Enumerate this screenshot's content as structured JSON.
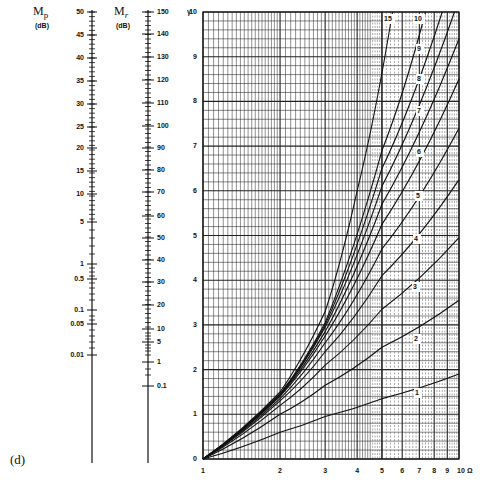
{
  "panel_label": "(d)",
  "scales": {
    "mp": {
      "title_main": "M",
      "title_sub": "p",
      "unit": "(dB)",
      "ticks": [
        {
          "label": "50",
          "y": 12
        },
        {
          "label": "45",
          "y": 35
        },
        {
          "label": "40",
          "y": 58
        },
        {
          "label": "35",
          "y": 81
        },
        {
          "label": "30",
          "y": 104
        },
        {
          "label": "25",
          "y": 127
        },
        {
          "label": "20",
          "y": 148
        },
        {
          "label": "15",
          "y": 171
        },
        {
          "label": "10",
          "y": 194
        },
        {
          "label": "5",
          "y": 222
        },
        {
          "label": "1",
          "y": 264
        },
        {
          "label": "0.5",
          "y": 279
        },
        {
          "label": "0.1",
          "y": 310
        },
        {
          "label": "0.05",
          "y": 324
        },
        {
          "label": "0.01",
          "y": 355
        }
      ]
    },
    "mr": {
      "title_main": "M",
      "title_sub": "r",
      "unit": "(dB)",
      "ticks": [
        {
          "label": "150",
          "y": 12
        },
        {
          "label": "140",
          "y": 34
        },
        {
          "label": "130",
          "y": 57
        },
        {
          "label": "120",
          "y": 80
        },
        {
          "label": "110",
          "y": 103
        },
        {
          "label": "100",
          "y": 126
        },
        {
          "label": "90",
          "y": 148
        },
        {
          "label": "80",
          "y": 170
        },
        {
          "label": "70",
          "y": 192
        },
        {
          "label": "60",
          "y": 216
        },
        {
          "label": "50",
          "y": 238
        },
        {
          "label": "40",
          "y": 260
        },
        {
          "label": "30",
          "y": 282
        },
        {
          "label": "20",
          "y": 305
        },
        {
          "label": "10",
          "y": 329
        },
        {
          "label": "5",
          "y": 342
        },
        {
          "label": "1",
          "y": 362
        },
        {
          "label": "0.1",
          "y": 386
        }
      ]
    }
  },
  "chart_data": {
    "type": "line",
    "title": "",
    "xlabel": "Ω",
    "ylabel": "γ",
    "x_scale": "log",
    "xlim": [
      1,
      10
    ],
    "ylim": [
      0,
      10
    ],
    "x_tick_labels": [
      "1",
      "2",
      "3",
      "4",
      "5",
      "6",
      "7",
      "8",
      "9",
      "10"
    ],
    "y_tick_labels": [
      "0",
      "1",
      "2",
      "3",
      "4",
      "5",
      "6",
      "7",
      "8",
      "9",
      "10"
    ],
    "grid": true,
    "series": [
      {
        "name": "1",
        "x": [
          1,
          2,
          3,
          5,
          10
        ],
        "y": [
          0,
          0.6,
          0.95,
          1.35,
          1.9
        ]
      },
      {
        "name": "2",
        "x": [
          1,
          2,
          3,
          5,
          10
        ],
        "y": [
          0,
          1.0,
          1.65,
          2.5,
          3.55
        ]
      },
      {
        "name": "3",
        "x": [
          1,
          2,
          3,
          5,
          10
        ],
        "y": [
          0,
          1.2,
          2.1,
          3.35,
          4.95
        ]
      },
      {
        "name": "4",
        "x": [
          1,
          2,
          3,
          5,
          10
        ],
        "y": [
          0,
          1.3,
          2.4,
          4.1,
          6.25
        ]
      },
      {
        "name": "5",
        "x": [
          1,
          2,
          3,
          5,
          10
        ],
        "y": [
          0,
          1.35,
          2.6,
          4.7,
          7.4
        ]
      },
      {
        "name": "6",
        "x": [
          1,
          2,
          3,
          5,
          10
        ],
        "y": [
          0,
          1.4,
          2.75,
          5.25,
          8.5
        ]
      },
      {
        "name": "7",
        "x": [
          1,
          2,
          3,
          5,
          10
        ],
        "y": [
          0,
          1.42,
          2.85,
          5.7,
          9.4
        ]
      },
      {
        "name": "8",
        "x": [
          1,
          2,
          3,
          5,
          9.6
        ],
        "y": [
          0,
          1.44,
          2.95,
          6.1,
          10
        ]
      },
      {
        "name": "9",
        "x": [
          1,
          2,
          3,
          5,
          8.6
        ],
        "y": [
          0,
          1.45,
          3.0,
          6.5,
          10
        ]
      },
      {
        "name": "10",
        "x": [
          1,
          2,
          3,
          5,
          7.4
        ],
        "y": [
          0,
          1.46,
          3.05,
          6.9,
          10
        ]
      },
      {
        "name": "15",
        "x": [
          1,
          2,
          3,
          4,
          5.5
        ],
        "y": [
          0,
          1.5,
          3.3,
          6.0,
          10
        ]
      }
    ],
    "curve_labels": [
      {
        "label": "15",
        "x": 387,
        "y": 19
      },
      {
        "label": "10",
        "x": 417,
        "y": 19
      },
      {
        "label": "9",
        "x": 420,
        "y": 49
      },
      {
        "label": "8",
        "x": 420,
        "y": 79
      },
      {
        "label": "7",
        "x": 420,
        "y": 111
      },
      {
        "label": "6",
        "x": 420,
        "y": 152
      },
      {
        "label": "5",
        "x": 419,
        "y": 196
      },
      {
        "label": "4",
        "x": 417,
        "y": 239
      },
      {
        "label": "3",
        "x": 416,
        "y": 287
      },
      {
        "label": "2",
        "x": 417,
        "y": 339
      },
      {
        "label": "1",
        "x": 418,
        "y": 393
      }
    ]
  }
}
